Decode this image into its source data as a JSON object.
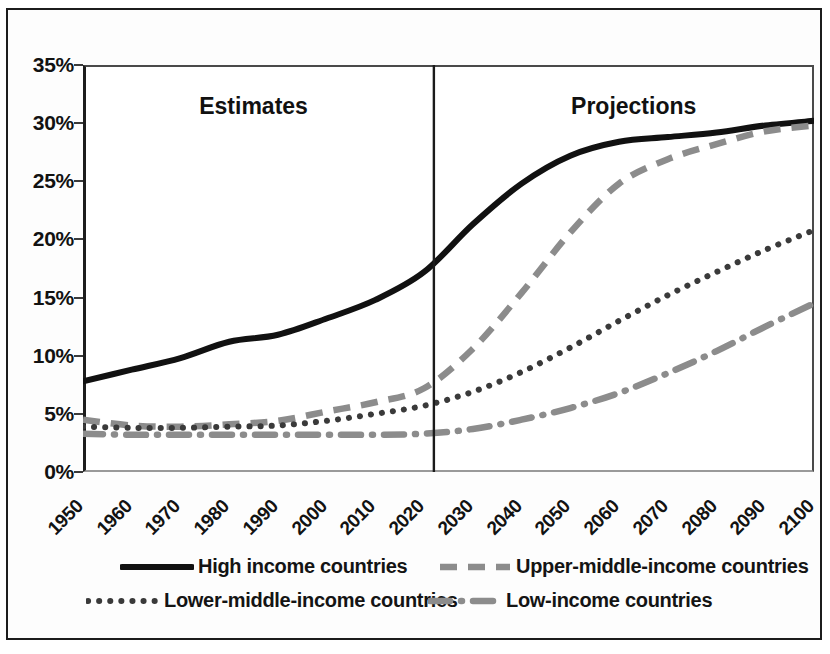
{
  "chart_data": {
    "type": "line",
    "title": "",
    "xlabel": "",
    "ylabel": "",
    "xlim": [
      1950,
      2100
    ],
    "ylim": [
      0,
      35
    ],
    "ytick_labels": [
      "35%",
      "30%",
      "25%",
      "20%",
      "15%",
      "10%",
      "5%",
      "0%"
    ],
    "ytick_values": [
      35,
      30,
      25,
      20,
      15,
      10,
      5,
      0
    ],
    "grid": false,
    "legend_position": "bottom",
    "x": [
      1950,
      1960,
      1970,
      1980,
      1990,
      2000,
      2010,
      2020,
      2030,
      2040,
      2050,
      2060,
      2070,
      2080,
      2090,
      2100
    ],
    "xtick_labels": [
      "1950",
      "1960",
      "1970",
      "1980",
      "1990",
      "2000",
      "2010",
      "2020",
      "2030",
      "2040",
      "2050",
      "2060",
      "2070",
      "2080",
      "2090",
      "2100"
    ],
    "annotations": [
      {
        "text": "Estimates",
        "x": 1985,
        "y": 31.5
      },
      {
        "text": "Projections",
        "x": 2063,
        "y": 31.5
      }
    ],
    "divider": {
      "x": 2022,
      "label": ""
    },
    "series": [
      {
        "name": "High income countries",
        "style": "solid",
        "color": "#111111",
        "values": [
          7.8,
          8.8,
          9.8,
          11.2,
          11.8,
          13.2,
          14.8,
          17.2,
          21.3,
          24.8,
          27.2,
          28.4,
          28.8,
          29.2,
          29.8,
          30.2
        ]
      },
      {
        "name": "Upper-middle-income countries",
        "style": "dashed",
        "color": "#8c8c8c",
        "values": [
          4.5,
          4.0,
          3.9,
          4.1,
          4.4,
          5.2,
          6.0,
          7.2,
          10.6,
          15.4,
          20.6,
          24.8,
          26.9,
          28.2,
          29.3,
          29.8
        ]
      },
      {
        "name": "Lower-middle-income countries",
        "style": "dotted",
        "color": "#3a3a3a",
        "values": [
          3.9,
          3.8,
          3.8,
          3.9,
          4.0,
          4.4,
          5.0,
          5.7,
          6.9,
          8.6,
          10.7,
          13.0,
          15.2,
          17.2,
          19.1,
          20.8
        ]
      },
      {
        "name": "Low-income countries",
        "style": "dashdot",
        "color": "#8c8c8c",
        "values": [
          3.3,
          3.2,
          3.2,
          3.2,
          3.2,
          3.2,
          3.2,
          3.3,
          3.7,
          4.5,
          5.5,
          6.8,
          8.5,
          10.4,
          12.5,
          14.5
        ]
      }
    ]
  },
  "legend": {
    "items": [
      {
        "label": "High income countries",
        "style": "solid"
      },
      {
        "label": "Upper-middle-income countries",
        "style": "dashed"
      },
      {
        "label": "Lower-middle-income countries",
        "style": "dotted"
      },
      {
        "label": "Low-income countries",
        "style": "dashdot"
      }
    ]
  }
}
